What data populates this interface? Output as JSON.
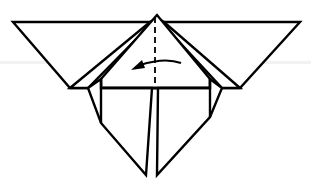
{
  "diagram": {
    "type": "origami-fold-step",
    "colors": {
      "line": "#000000",
      "paper": "#ffffff"
    },
    "instruction": {
      "fold_line": "valley-fold (dashed vertical center line)",
      "arrow_direction": "left"
    }
  }
}
